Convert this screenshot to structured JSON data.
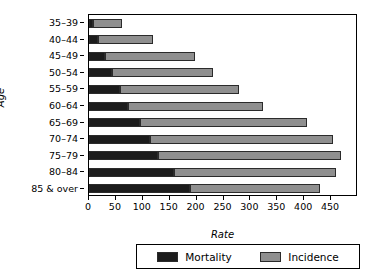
{
  "chart_data": {
    "type": "bar",
    "orientation": "horizontal",
    "stacked": true,
    "title": "",
    "xlabel": "Rate",
    "ylabel": "Age",
    "categories": [
      "35–39",
      "40–44",
      "45–49",
      "50–54",
      "55–59",
      "60–64",
      "65–69",
      "70–74",
      "75–79",
      "80–84",
      "85 & over"
    ],
    "series": [
      {
        "name": "Mortality",
        "color": "#1c1c1c",
        "values": [
          8,
          17,
          30,
          43,
          58,
          73,
          95,
          113,
          128,
          158,
          188
        ]
      },
      {
        "name": "Incidence",
        "color": "#8f8f8f",
        "values": [
          61,
          119,
          197,
          230,
          279,
          323,
          405,
          453,
          468,
          460,
          430
        ]
      }
    ],
    "xlim": [
      0,
      500
    ],
    "xticks": [
      0,
      50,
      100,
      150,
      200,
      250,
      300,
      350,
      400,
      450
    ],
    "xtick_labels": [
      "0",
      "50",
      "100",
      "150",
      "200",
      "250",
      "300",
      "350",
      "400",
      "450"
    ],
    "grid": false,
    "legend_position": "bottom",
    "legend_entries": [
      "Mortality",
      "Incidence"
    ]
  }
}
